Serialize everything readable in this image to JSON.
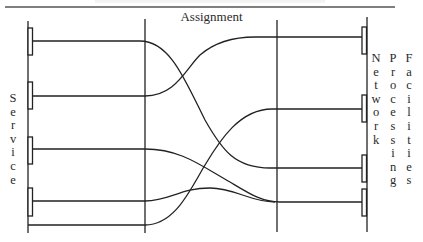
{
  "diagram": {
    "title": "Assignment",
    "left_group_label": "Service",
    "right_group_labels": [
      "Network",
      "Processing",
      "Facilities"
    ],
    "colors": {
      "line": "#222222",
      "text": "#2a2a2a",
      "background": "#ffffff"
    },
    "left_nodes": [
      {
        "id": "service-1",
        "y": 41
      },
      {
        "id": "service-2",
        "y": 96
      },
      {
        "id": "service-3",
        "y": 149
      },
      {
        "id": "service-4",
        "y": 201
      },
      {
        "id": "service-5",
        "y": 225
      }
    ],
    "right_nodes": [
      {
        "id": "facility-1",
        "y": 37
      },
      {
        "id": "facility-2",
        "y": 109
      },
      {
        "id": "facility-3",
        "y": 168
      },
      {
        "id": "facility-4",
        "y": 202
      }
    ],
    "assignments": [
      {
        "from": "service-1",
        "to": "facility-3"
      },
      {
        "from": "service-2",
        "to": "facility-1"
      },
      {
        "from": "service-3",
        "to": "facility-4"
      },
      {
        "from": "service-4",
        "to": "facility-4"
      },
      {
        "from": "service-5",
        "to": "facility-2"
      }
    ]
  }
}
